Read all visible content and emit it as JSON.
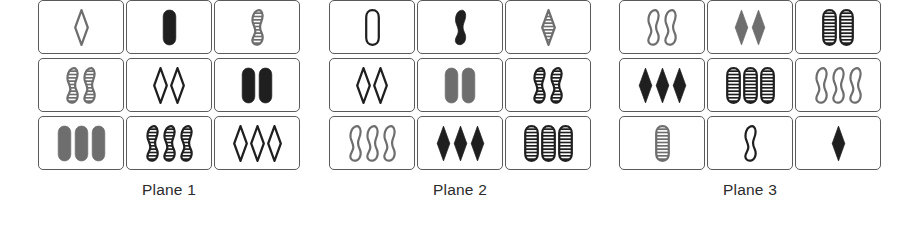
{
  "figure": {
    "colors": {
      "gray": "#6e6e6e",
      "dark": "#1f1f1f",
      "card_border": "#5a5a5a",
      "card_background": "#ffffff",
      "label_text": "#2b2b2b"
    },
    "shape_names": [
      "diamond",
      "pill",
      "squiggle"
    ],
    "fill_names": [
      "open",
      "solid",
      "striped"
    ],
    "planes": [
      {
        "label": "Plane 1",
        "cards": [
          {
            "count": 1,
            "shape": "diamond",
            "fill": "open",
            "color": "gray"
          },
          {
            "count": 1,
            "shape": "pill",
            "fill": "solid",
            "color": "dark"
          },
          {
            "count": 1,
            "shape": "squiggle",
            "fill": "striped",
            "color": "gray"
          },
          {
            "count": 2,
            "shape": "squiggle",
            "fill": "striped",
            "color": "gray"
          },
          {
            "count": 2,
            "shape": "diamond",
            "fill": "open",
            "color": "dark"
          },
          {
            "count": 2,
            "shape": "pill",
            "fill": "solid",
            "color": "dark"
          },
          {
            "count": 3,
            "shape": "pill",
            "fill": "solid",
            "color": "gray"
          },
          {
            "count": 3,
            "shape": "squiggle",
            "fill": "striped",
            "color": "dark"
          },
          {
            "count": 3,
            "shape": "diamond",
            "fill": "open",
            "color": "dark"
          }
        ]
      },
      {
        "label": "Plane 2",
        "cards": [
          {
            "count": 1,
            "shape": "pill",
            "fill": "open",
            "color": "dark"
          },
          {
            "count": 1,
            "shape": "squiggle",
            "fill": "solid",
            "color": "dark"
          },
          {
            "count": 1,
            "shape": "diamond",
            "fill": "striped",
            "color": "gray"
          },
          {
            "count": 2,
            "shape": "diamond",
            "fill": "open",
            "color": "dark"
          },
          {
            "count": 2,
            "shape": "pill",
            "fill": "solid",
            "color": "gray"
          },
          {
            "count": 2,
            "shape": "squiggle",
            "fill": "striped",
            "color": "dark"
          },
          {
            "count": 3,
            "shape": "squiggle",
            "fill": "open",
            "color": "gray"
          },
          {
            "count": 3,
            "shape": "diamond",
            "fill": "solid",
            "color": "dark"
          },
          {
            "count": 3,
            "shape": "pill",
            "fill": "striped",
            "color": "dark"
          }
        ]
      },
      {
        "label": "Plane 3",
        "cards": [
          {
            "count": 2,
            "shape": "squiggle",
            "fill": "open",
            "color": "gray"
          },
          {
            "count": 2,
            "shape": "diamond",
            "fill": "solid",
            "color": "gray"
          },
          {
            "count": 2,
            "shape": "pill",
            "fill": "striped",
            "color": "dark"
          },
          {
            "count": 3,
            "shape": "diamond",
            "fill": "solid",
            "color": "dark"
          },
          {
            "count": 3,
            "shape": "pill",
            "fill": "striped",
            "color": "dark"
          },
          {
            "count": 3,
            "shape": "squiggle",
            "fill": "open",
            "color": "gray"
          },
          {
            "count": 1,
            "shape": "pill",
            "fill": "striped",
            "color": "gray"
          },
          {
            "count": 1,
            "shape": "squiggle",
            "fill": "open",
            "color": "dark"
          },
          {
            "count": 1,
            "shape": "diamond",
            "fill": "solid",
            "color": "dark"
          }
        ]
      }
    ]
  }
}
